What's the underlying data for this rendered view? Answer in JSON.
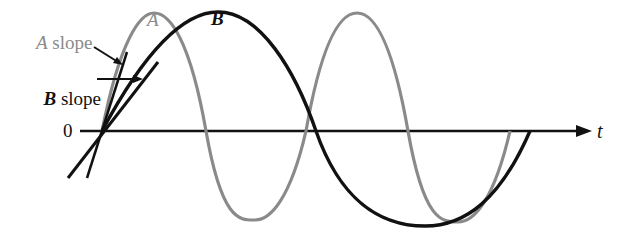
{
  "diagram": {
    "axis": {
      "origin_label": "0",
      "time_label": "t"
    },
    "curves": [
      {
        "name": "A",
        "label": "A",
        "color": "#8a8a8a",
        "periods_shown": 2
      },
      {
        "name": "B",
        "label": "B",
        "color": "#111111",
        "periods_shown": 1
      }
    ],
    "annotations": {
      "a_slope": {
        "italic": "A",
        "text": " slope"
      },
      "b_slope": {
        "italic": "B",
        "text": " slope"
      }
    }
  }
}
